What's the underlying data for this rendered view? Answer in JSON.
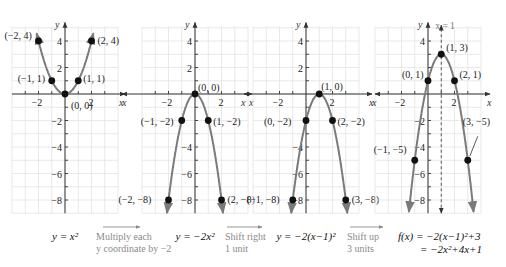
{
  "chart_data": [
    {
      "type": "line",
      "title": "y = x^2",
      "equation_label": "y = x²",
      "xlabel": "x",
      "ylabel": "y",
      "xlim": [
        -4,
        4
      ],
      "ylim": [
        -9,
        5
      ],
      "x_ticks": [
        -2,
        2
      ],
      "y_ticks": [
        4,
        2,
        -2,
        -4,
        -6,
        -8
      ],
      "grid": true,
      "points": [
        {
          "x": -2,
          "y": 4,
          "label": "(−2, 4)"
        },
        {
          "x": -1,
          "y": 1,
          "label": "(−1, 1)"
        },
        {
          "x": 0,
          "y": 0,
          "label": "(0, 0)"
        },
        {
          "x": 1,
          "y": 1,
          "label": "(1, 1)"
        },
        {
          "x": 2,
          "y": 4,
          "label": "(2, 4)"
        }
      ]
    },
    {
      "type": "line",
      "title": "y = -2x^2",
      "equation_label": "y = −2x²",
      "xlabel": "x",
      "ylabel": "y",
      "xlim": [
        -4,
        4
      ],
      "ylim": [
        -9,
        5
      ],
      "x_ticks": [
        -2,
        2
      ],
      "y_ticks": [
        4,
        2,
        -4,
        -6,
        -8
      ],
      "grid": true,
      "points": [
        {
          "x": -2,
          "y": -8,
          "label": "(−2, −8)"
        },
        {
          "x": -1,
          "y": -2,
          "label": "(−1, −2)"
        },
        {
          "x": 0,
          "y": 0,
          "label": "(0, 0)"
        },
        {
          "x": 1,
          "y": -2,
          "label": "(1, −2)"
        },
        {
          "x": 2,
          "y": -8,
          "label": "(2, −8)"
        }
      ]
    },
    {
      "type": "line",
      "title": "y = -2(x-1)^2",
      "equation_label": "y = −2(x−1)²",
      "xlabel": "x",
      "ylabel": "y",
      "xlim": [
        -4,
        4
      ],
      "ylim": [
        -9,
        5
      ],
      "x_ticks": [
        -2,
        2
      ],
      "y_ticks": [
        4,
        2,
        -4,
        -6,
        -8
      ],
      "grid": true,
      "points": [
        {
          "x": -1,
          "y": -8,
          "label": "(−1, −8)"
        },
        {
          "x": 0,
          "y": -2,
          "label": "(0, −2)"
        },
        {
          "x": 1,
          "y": 0,
          "label": "(1, 0)"
        },
        {
          "x": 2,
          "y": -2,
          "label": "(2, −2)"
        },
        {
          "x": 3,
          "y": -8,
          "label": "(3, −8)"
        }
      ]
    },
    {
      "type": "line",
      "title": "f(x) = -2(x-1)^2 + 3 = -2x^2 + 4x + 1",
      "equation_label_line1": "f(x) = −2(x−1)²+3",
      "equation_label_line2": "= −2x²+4x+1",
      "xlabel": "x",
      "ylabel": "y",
      "xlim": [
        -4,
        4
      ],
      "ylim": [
        -9,
        5
      ],
      "x_ticks": [
        -2,
        2
      ],
      "y_ticks": [
        4,
        -2,
        -4,
        -6,
        -8
      ],
      "grid": true,
      "axis_of_symmetry": "x = 1",
      "points": [
        {
          "x": -1,
          "y": -5,
          "label": "(−1, −5)"
        },
        {
          "x": 0,
          "y": 1,
          "label": "(0, 1)"
        },
        {
          "x": 1,
          "y": 3,
          "label": "(1, 3)"
        },
        {
          "x": 2,
          "y": 1,
          "label": "(2, 1)"
        },
        {
          "x": 3,
          "y": -5,
          "label": "(3, −5)"
        }
      ]
    }
  ],
  "steps": [
    {
      "line1": "Multiply each",
      "line2": "y coordinate by −2"
    },
    {
      "line1": "Shift right",
      "line2": "1 unit"
    },
    {
      "line1": "Shift up",
      "line2": "3 units"
    }
  ],
  "axis_names": {
    "x": "x",
    "y": "y"
  },
  "tick_labels": {
    "neg2": "−2",
    "pos2": "2",
    "y4": "4",
    "y2": "2",
    "yneg2": "−2",
    "yneg4": "−4",
    "yneg6": "−6",
    "yneg8": "−8"
  }
}
